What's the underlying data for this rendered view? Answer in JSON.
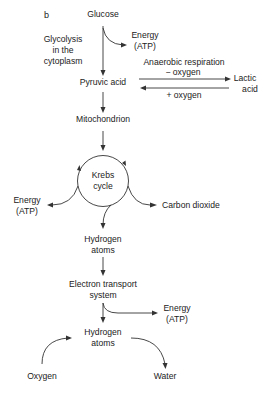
{
  "figure": {
    "panel_label": "b",
    "colors": {
      "ink": "#222222",
      "background": "#ffffff"
    }
  },
  "nodes": {
    "glucose": "Glucose",
    "energy_top": [
      "Energy",
      "(ATP)"
    ],
    "glycolysis_note": [
      "Glycolysis",
      "in the",
      "cytoplasm"
    ],
    "pyruvic_acid": "Pyruvic acid",
    "anaerobic_label": "Anaerobic respiration",
    "minus_oxygen": "− oxygen",
    "plus_oxygen": "+ oxygen",
    "lactic_acid": [
      "Lactic",
      "acid"
    ],
    "mitochondrion": "Mitochondrion",
    "krebs_cycle": [
      "Krebs",
      "cycle"
    ],
    "energy_left": [
      "Energy",
      "(ATP)"
    ],
    "carbon_dioxide": "Carbon dioxide",
    "hydrogen_atoms_1": [
      "Hydrogen",
      "atoms"
    ],
    "electron_transport": [
      "Electron transport",
      "system"
    ],
    "energy_bottom": [
      "Energy",
      "(ATP)"
    ],
    "hydrogen_atoms_2": [
      "Hydrogen",
      "atoms"
    ],
    "oxygen": "Oxygen",
    "water": "Water"
  },
  "edges": [
    {
      "from": "glucose",
      "to": "pyruvic_acid"
    },
    {
      "from": "glucose",
      "to": "energy_top"
    },
    {
      "from": "pyruvic_acid",
      "to": "lactic_acid",
      "label": "− oxygen"
    },
    {
      "from": "lactic_acid",
      "to": "pyruvic_acid",
      "label": "+ oxygen"
    },
    {
      "from": "pyruvic_acid",
      "to": "mitochondrion"
    },
    {
      "from": "mitochondrion",
      "to": "krebs_cycle"
    },
    {
      "from": "krebs_cycle",
      "to": "energy_left"
    },
    {
      "from": "krebs_cycle",
      "to": "carbon_dioxide"
    },
    {
      "from": "krebs_cycle",
      "to": "hydrogen_atoms_1"
    },
    {
      "from": "hydrogen_atoms_1",
      "to": "electron_transport"
    },
    {
      "from": "electron_transport",
      "to": "energy_bottom"
    },
    {
      "from": "electron_transport",
      "to": "hydrogen_atoms_2"
    },
    {
      "from": "oxygen",
      "to": "hydrogen_atoms_2"
    },
    {
      "from": "hydrogen_atoms_2",
      "to": "water"
    }
  ]
}
